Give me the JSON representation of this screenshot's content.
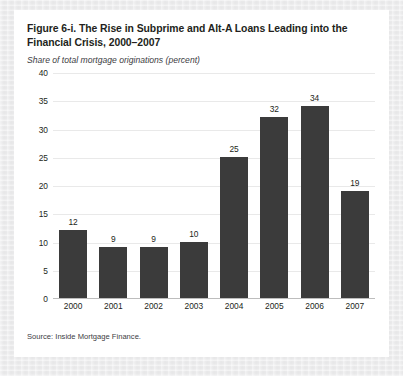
{
  "figure": {
    "title": "Figure 6-i. The Rise in Subprime and Alt-A Loans Leading into the Financial Crisis, 2000–2007",
    "subtitle": "Share of total mortgage originations (percent)",
    "source": "Source: Inside Mortgage Finance."
  },
  "colors": {
    "bar": "#3b3b3b",
    "page_background": "#ebebec",
    "card_background": "#ffffff",
    "gridline": "#e9e9e9",
    "axis": "#bdbdbd",
    "text": "#231f20"
  },
  "chart_data": {
    "type": "bar",
    "title": "Figure 6-i. The Rise in Subprime and Alt-A Loans Leading into the Financial Crisis, 2000–2007",
    "subtitle": "Share of total mortgage originations (percent)",
    "xlabel": "",
    "ylabel": "Share of total mortgage originations (percent)",
    "categories": [
      "2000",
      "2001",
      "2002",
      "2003",
      "2004",
      "2005",
      "2006",
      "2007"
    ],
    "values": [
      12,
      9,
      9,
      10,
      25,
      32,
      34,
      19
    ],
    "ylim": [
      0,
      40
    ],
    "yticks": [
      0,
      5,
      10,
      15,
      20,
      25,
      30,
      35,
      40
    ],
    "ytick_labels": [
      "0",
      "5",
      "10",
      "15",
      "20",
      "25",
      "30",
      "35",
      "40"
    ],
    "grid": true,
    "legend": false,
    "data_labels": true,
    "source": "Source: Inside Mortgage Finance."
  }
}
